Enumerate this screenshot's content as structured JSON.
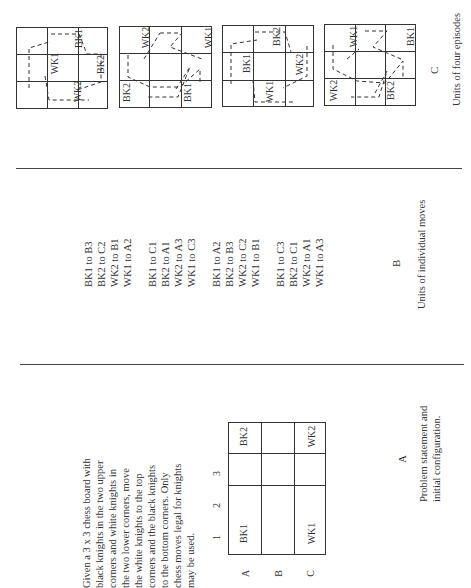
{
  "panelA": {
    "letter": "A",
    "problem_text": [
      "Given a 3 x 3 chess board with",
      "black knights in the two upper",
      "corners and white knights in",
      "the two lower corners, move",
      "the white knights to the top",
      "corners and the black knights",
      "to the bottom corners. Only",
      "chess moves legal for knights",
      "may be used."
    ],
    "column_labels": [
      "1",
      "2",
      "3"
    ],
    "row_labels": [
      "A",
      "B",
      "C"
    ],
    "board": {
      "A1": "BK1",
      "A3": "BK2",
      "C1": "WK1",
      "C3": "WK2"
    },
    "caption": [
      "Problem statement and",
      "initial configuration."
    ]
  },
  "panelB": {
    "letter": "B",
    "move_groups": [
      [
        "BK1 to B3",
        "BK2 to C2",
        "WK2 to B1",
        "WK1 to A2"
      ],
      [
        "BK1 to C1",
        "BK2 to A1",
        "WK2 to A3",
        "WK1 to C3"
      ],
      [
        "BK1 to A2",
        "BK2 to B3",
        "WK2 to C2",
        "WK1 to B1"
      ],
      [
        "BK1 to C3",
        "BK2 to C1",
        "WK2 to A1",
        "WK1 to A3"
      ]
    ],
    "caption": "Units of individual moves"
  },
  "panelC": {
    "letter": "C",
    "caption": "Units of four episodes",
    "episode_boards": [
      {
        "labels": [
          "WK1",
          "BK1",
          "BK2",
          "WK2"
        ]
      },
      {
        "labels": [
          "WK2",
          "WK1",
          "BK2",
          "BK1"
        ]
      },
      {
        "labels": [
          "BK1",
          "BK2",
          "WK2",
          "WK1"
        ]
      },
      {
        "labels": [
          "WK1",
          "BK1",
          "WK2",
          "BK2"
        ]
      }
    ]
  }
}
